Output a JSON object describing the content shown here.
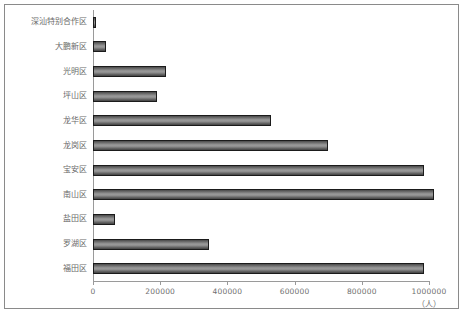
{
  "chart_data": {
    "type": "bar",
    "orientation": "horizontal",
    "title": "",
    "xlabel": "（人）",
    "ylabel": "",
    "xlim": [
      0,
      1060000
    ],
    "xticks": [
      0,
      200000,
      400000,
      600000,
      800000,
      1000000
    ],
    "xtick_labels": [
      "0",
      "200000",
      "400000",
      "600000",
      "800000",
      "1000000"
    ],
    "grid": false,
    "legend": false,
    "categories": [
      "深汕特别合作区",
      "大鹏新区",
      "光明区",
      "坪山区",
      "龙华区",
      "龙岗区",
      "宝安区",
      "南山区",
      "盐田区",
      "罗湖区",
      "福田区"
    ],
    "values": [
      5000,
      38000,
      216000,
      190000,
      530000,
      700000,
      985000,
      1015000,
      65000,
      345000,
      985000
    ],
    "bar_color_dark": "#434343",
    "bar_color_light": "#9b9b9b",
    "bar_border_color": "#1b1b1b",
    "axis_color": "#9a9a9a",
    "tick_label_color": "#6f6f6f",
    "category_label_color": "#6a6a6a",
    "frame_color": "#8a8a8a",
    "background_color": "#ffffff"
  }
}
